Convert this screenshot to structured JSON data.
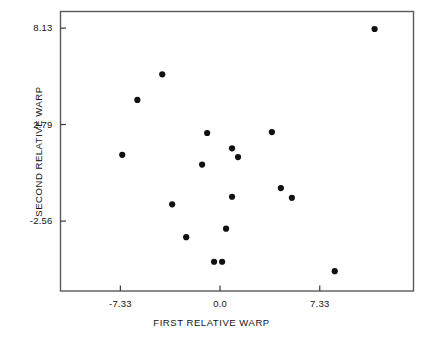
{
  "chart_data": {
    "type": "scatter",
    "title": "",
    "xlabel": "FIRST RELATIVE WARP",
    "ylabel": "SECOND RELATIVE WARP",
    "xticks": [
      -7.33,
      0.0,
      7.33
    ],
    "xtick_labels": [
      "-7.33",
      "0.0",
      "7.33"
    ],
    "yticks": [
      8.13,
      2.79,
      -2.56
    ],
    "ytick_labels": [
      "8.13",
      "2.79",
      "-2.56"
    ],
    "xlim": [
      -11.73,
      14.22
    ],
    "ylim": [
      -6.43,
      9.05
    ],
    "grid": false,
    "legend": null,
    "marker": "filled-circle",
    "marker_color": "#111111",
    "marker_size_px": 5,
    "frame_color": "#5a5a5a",
    "background": "#ffffff",
    "points": [
      {
        "x": -4.25,
        "y": 5.57
      },
      {
        "x": -6.08,
        "y": 4.15
      },
      {
        "x": -7.19,
        "y": 1.11
      },
      {
        "x": -0.95,
        "y": 2.32
      },
      {
        "x": 3.81,
        "y": 2.37
      },
      {
        "x": 0.88,
        "y": 1.47
      },
      {
        "x": 1.32,
        "y": 0.99
      },
      {
        "x": -1.32,
        "y": 0.57
      },
      {
        "x": 4.47,
        "y": -0.73
      },
      {
        "x": 5.28,
        "y": -1.27
      },
      {
        "x": 0.88,
        "y": -1.21
      },
      {
        "x": -3.52,
        "y": -1.63
      },
      {
        "x": 0.44,
        "y": -2.98
      },
      {
        "x": -2.49,
        "y": -3.45
      },
      {
        "x": -0.44,
        "y": -4.81
      },
      {
        "x": 0.15,
        "y": -4.81
      },
      {
        "x": 8.43,
        "y": -5.33
      },
      {
        "x": 11.36,
        "y": 8.08
      }
    ]
  },
  "axis": {
    "x_title": "FIRST RELATIVE WARP",
    "y_title": "SECOND RELATIVE WARP"
  }
}
